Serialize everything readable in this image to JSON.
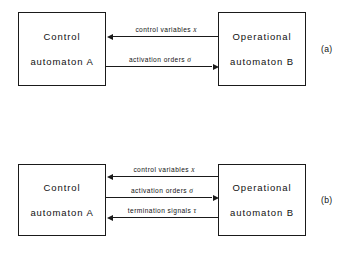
{
  "figure": {
    "type": "block-diagram",
    "background_color": "#ffffff",
    "line_color": "#1a1a1a",
    "text_color": "#111111"
  },
  "panels": [
    {
      "tag": "(a)",
      "blocks": [
        {
          "name": "control-automaton",
          "line1": "Control",
          "line2": "automaton A"
        },
        {
          "name": "operational-automaton",
          "line1": "Operational",
          "line2": "automaton B"
        }
      ],
      "arrows": [
        {
          "label_text": "control variables",
          "label_symbol": "x",
          "direction": "right-to-left",
          "from": "operational-automaton",
          "to": "control-automaton"
        },
        {
          "label_text": "activation  orders",
          "label_symbol": "σ",
          "direction": "left-to-right",
          "from": "control-automaton",
          "to": "operational-automaton"
        }
      ]
    },
    {
      "tag": "(b)",
      "blocks": [
        {
          "name": "control-automaton",
          "line1": "Control",
          "line2": "automaton A"
        },
        {
          "name": "operational-automaton",
          "line1": "Operational",
          "line2": "automaton B"
        }
      ],
      "arrows": [
        {
          "label_text": "control variables",
          "label_symbol": "x",
          "direction": "right-to-left",
          "from": "operational-automaton",
          "to": "control-automaton"
        },
        {
          "label_text": "activation  orders",
          "label_symbol": "σ",
          "direction": "left-to-right",
          "from": "control-automaton",
          "to": "operational-automaton"
        },
        {
          "label_text": "termination  signals",
          "label_symbol": "τ",
          "direction": "right-to-left",
          "from": "operational-automaton",
          "to": "control-automaton"
        }
      ]
    }
  ]
}
